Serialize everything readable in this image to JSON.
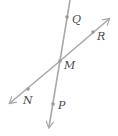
{
  "diagram": {
    "type": "intersecting-lines",
    "colors": {
      "line": "#a9a9a9",
      "point": "#9a9a9a",
      "label": "#4a4a4a"
    },
    "lines": [
      {
        "name": "line-QP",
        "from": [
          70,
          0
        ],
        "to": [
          49,
          127
        ],
        "arrow_end": "bottom"
      },
      {
        "name": "line-NR",
        "from": [
          10,
          103
        ],
        "to": [
          109,
          19
        ],
        "arrow_end": "both"
      }
    ],
    "intersection": {
      "label": "M",
      "x": 60,
      "y": 61
    },
    "points": [
      {
        "label": "Q",
        "x": 67,
        "y": 17
      },
      {
        "label": "R",
        "x": 93,
        "y": 32
      },
      {
        "label": "M",
        "x": 60,
        "y": 61
      },
      {
        "label": "N",
        "x": 28,
        "y": 89
      },
      {
        "label": "P",
        "x": 53,
        "y": 104
      }
    ],
    "labels": {
      "Q": "Q",
      "R": "R",
      "M": "M",
      "N": "N",
      "P": "P"
    }
  }
}
